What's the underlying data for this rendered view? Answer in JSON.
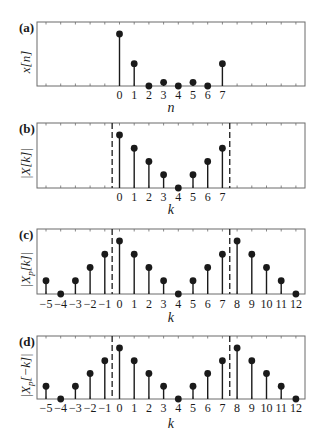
{
  "figure": {
    "colors": {
      "ink": "#1a1a1a",
      "axis": "#6b6b6b",
      "dash": "#1a1a1a"
    }
  },
  "chart_data": [
    {
      "panel": "(a)",
      "type": "stem",
      "ylabel": "x[n]",
      "xlabel": "n",
      "x": [
        0,
        1,
        2,
        3,
        4,
        5,
        6,
        7
      ],
      "values": [
        1.0,
        0.43,
        0.0,
        0.07,
        0.0,
        0.07,
        0.0,
        0.43
      ],
      "tick_labels": [
        "0",
        "1",
        "2",
        "3",
        "4",
        "5",
        "6",
        "7"
      ],
      "dashed_lines": [],
      "box": {
        "top": 22,
        "bottom": 86
      },
      "tick_y": 99,
      "xlabel_y": 112
    },
    {
      "panel": "(b)",
      "type": "stem",
      "ylabel": "|X[k]|",
      "xlabel": "k",
      "x": [
        0,
        1,
        2,
        3,
        4,
        5,
        6,
        7
      ],
      "values": [
        1.0,
        0.75,
        0.5,
        0.25,
        0.0,
        0.25,
        0.5,
        0.75
      ],
      "tick_labels": [
        "0",
        "1",
        "2",
        "3",
        "4",
        "5",
        "6",
        "7"
      ],
      "dashed_lines": [
        -0.5,
        7.5
      ],
      "box": {
        "top": 123,
        "bottom": 188
      },
      "tick_y": 201,
      "xlabel_y": 214
    },
    {
      "panel": "(c)",
      "type": "stem",
      "ylabel": "|X_p[k]|",
      "xlabel": "k",
      "x": [
        -5,
        -4,
        -3,
        -2,
        -1,
        0,
        1,
        2,
        3,
        4,
        5,
        6,
        7,
        8,
        9,
        10,
        11,
        12
      ],
      "values": [
        0.25,
        0.0,
        0.25,
        0.5,
        0.75,
        1.0,
        0.75,
        0.5,
        0.25,
        0.0,
        0.25,
        0.5,
        0.75,
        1.0,
        0.75,
        0.5,
        0.25,
        0.0
      ],
      "tick_labels": [
        "−5",
        "−4",
        "−3",
        "−2",
        "−1",
        "0",
        "1",
        "2",
        "3",
        "4",
        "5",
        "6",
        "7",
        "8",
        "9",
        "10",
        "11",
        "12"
      ],
      "dashed_lines": [
        -0.5,
        7.5
      ],
      "box": {
        "top": 229,
        "bottom": 294
      },
      "tick_y": 308,
      "xlabel_y": 322
    },
    {
      "panel": "(d)",
      "type": "stem",
      "ylabel": "|X_p[−k]|",
      "xlabel": "k",
      "x": [
        -5,
        -4,
        -3,
        -2,
        -1,
        0,
        1,
        2,
        3,
        4,
        5,
        6,
        7,
        8,
        9,
        10,
        11,
        12
      ],
      "values": [
        0.25,
        0.0,
        0.25,
        0.5,
        0.75,
        1.0,
        0.75,
        0.5,
        0.25,
        0.0,
        0.25,
        0.5,
        0.75,
        1.0,
        0.75,
        0.5,
        0.25,
        0.0
      ],
      "tick_labels": [
        "−5",
        "−4",
        "−3",
        "−2",
        "−1",
        "0",
        "1",
        "2",
        "3",
        "4",
        "5",
        "6",
        "7",
        "8",
        "9",
        "10",
        "11",
        "12"
      ],
      "dashed_lines": [
        -0.5,
        7.5
      ],
      "box": {
        "top": 336,
        "bottom": 399
      },
      "tick_y": 412,
      "xlabel_y": 428
    }
  ]
}
